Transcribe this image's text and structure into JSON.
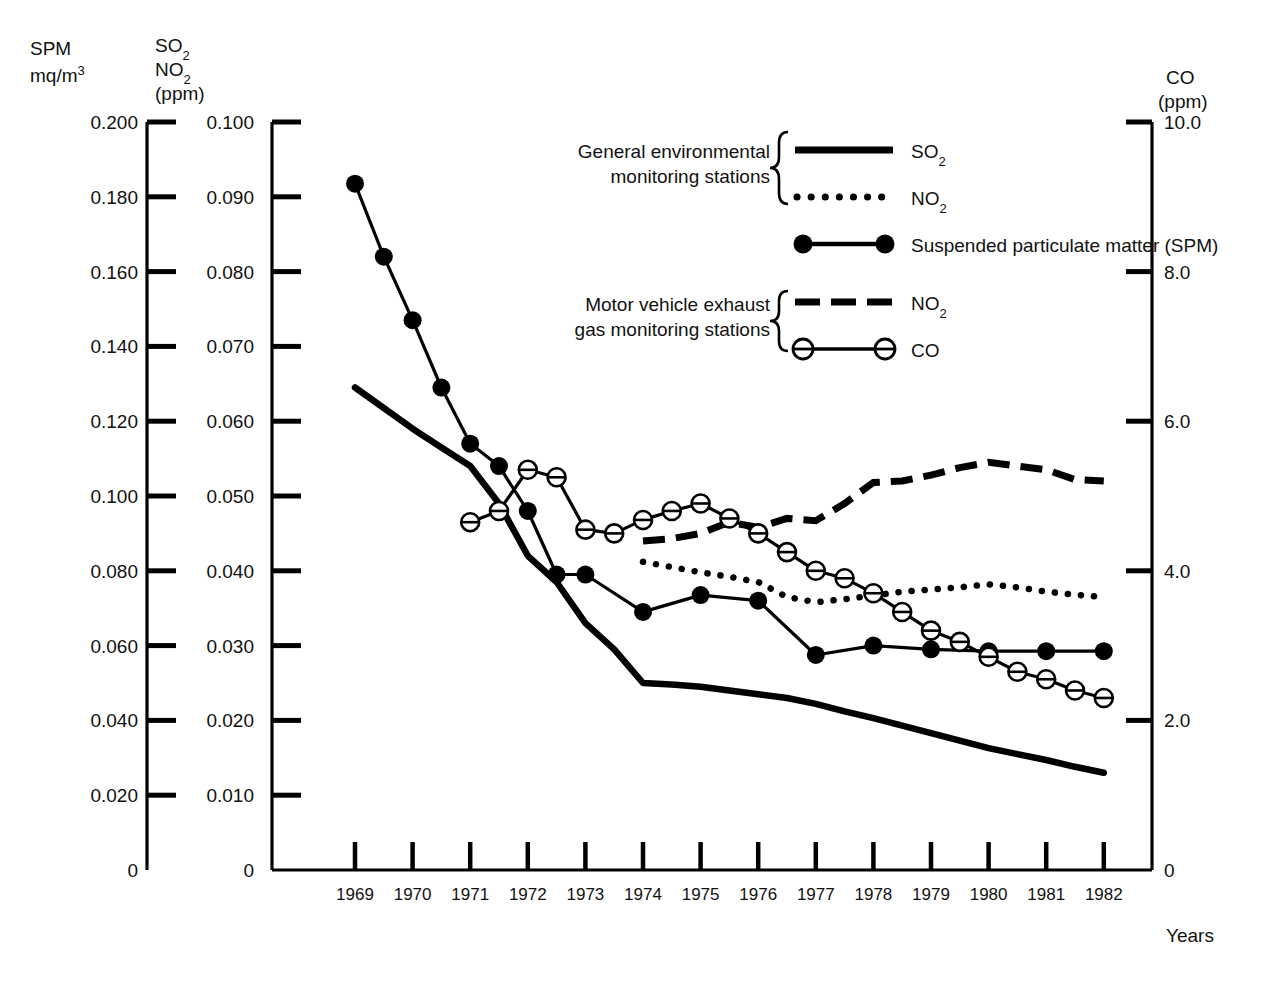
{
  "axes": {
    "left_outer": {
      "title_line1": "SPM",
      "title_line2_main": "mq/m",
      "title_line2_sup": "3",
      "ticks": [
        "0.200",
        "0.180",
        "0.160",
        "0.140",
        "0.120",
        "0.100",
        "0.080",
        "0.060",
        "0.040",
        "0.020",
        "0"
      ],
      "values": [
        0.2,
        0.18,
        0.16,
        0.14,
        0.12,
        0.1,
        0.08,
        0.06,
        0.04,
        0.02,
        0
      ]
    },
    "left_inner": {
      "title_line1_main": "SO",
      "title_line1_sub": "2",
      "title_line2_main": "NO",
      "title_line2_sub": "2",
      "title_line3": "(ppm)",
      "ticks": [
        "0.100",
        "0.090",
        "0.080",
        "0.070",
        "0.060",
        "0.050",
        "0.040",
        "0.030",
        "0.020",
        "0.010",
        "0"
      ],
      "values": [
        0.1,
        0.09,
        0.08,
        0.07,
        0.06,
        0.05,
        0.04,
        0.03,
        0.02,
        0.01,
        0
      ]
    },
    "right": {
      "title_line1": "CO",
      "title_line2": "(ppm)",
      "ticks": [
        "10.0",
        "8.0",
        "6.0",
        "4.0",
        "2.0",
        "0"
      ],
      "values": [
        10.0,
        8.0,
        6.0,
        4.0,
        2.0,
        0
      ]
    },
    "x": {
      "label": "Years",
      "ticks": [
        "1969",
        "1970",
        "1971",
        "1972",
        "1973",
        "1974",
        "1975",
        "1976",
        "1977",
        "1978",
        "1979",
        "1980",
        "1981",
        "1982"
      ]
    }
  },
  "legend": {
    "group1_line1": "General environmental",
    "group1_line2": "monitoring stations",
    "group2_line1": "Motor vehicle exhaust",
    "group2_line2": "gas monitoring stations",
    "items": [
      {
        "style": "solid-thick",
        "label_main": "SO",
        "label_sub": "2",
        "label_tail": ""
      },
      {
        "style": "dotted",
        "label_main": "NO",
        "label_sub": "2",
        "label_tail": ""
      },
      {
        "style": "line-filled-dots",
        "label_main": "Suspended particulate matter (SPM)",
        "label_sub": "",
        "label_tail": ""
      },
      {
        "style": "dashed",
        "label_main": "NO",
        "label_sub": "2",
        "label_tail": ""
      },
      {
        "style": "line-open-dots",
        "label_main": "CO",
        "label_sub": "",
        "label_tail": ""
      }
    ]
  },
  "chart_data": {
    "type": "line",
    "title": "",
    "xlabel": "Years",
    "grid": false,
    "legend_position": "top-center",
    "x": [
      1969,
      1970,
      1971,
      1972,
      1973,
      1974,
      1975,
      1976,
      1977,
      1978,
      1979,
      1980,
      1981,
      1982
    ],
    "xlim": [
      1968.6,
      1982.6
    ],
    "series": [
      {
        "name": "SO2 (general environmental monitoring stations)",
        "axis": "left_inner",
        "unit": "ppm",
        "style": "solid-thick",
        "x": [
          1969.0,
          1970.0,
          1970.5,
          1971.0,
          1971.5,
          1972.0,
          1972.5,
          1973.0,
          1973.5,
          1974.0,
          1974.5,
          1975.0,
          1975.5,
          1976.0,
          1976.5,
          1977.0,
          1977.5,
          1978.0,
          1978.5,
          1979.0,
          1979.5,
          1980.0,
          1980.5,
          1981.0,
          1981.5,
          1982.0
        ],
        "y": [
          0.0645,
          0.059,
          0.0565,
          0.054,
          0.049,
          0.042,
          0.0385,
          0.033,
          0.0295,
          0.025,
          0.0248,
          0.0245,
          0.024,
          0.0235,
          0.023,
          0.0222,
          0.0212,
          0.0203,
          0.0193,
          0.0183,
          0.0173,
          0.0163,
          0.0155,
          0.0147,
          0.0138,
          0.013
        ],
        "ylim": [
          0,
          0.1
        ]
      },
      {
        "name": "NO2 (general environmental monitoring stations)",
        "axis": "left_inner",
        "unit": "ppm",
        "style": "dotted",
        "x": [
          1974.0,
          1974.5,
          1975.0,
          1975.5,
          1976.0,
          1976.5,
          1977.0,
          1977.5,
          1978.0,
          1978.5,
          1979.0,
          1979.5,
          1980.0,
          1980.5,
          1981.0,
          1981.5,
          1982.0
        ],
        "y": [
          0.0412,
          0.0405,
          0.0398,
          0.0392,
          0.0385,
          0.0365,
          0.0358,
          0.0362,
          0.0367,
          0.0372,
          0.0375,
          0.0378,
          0.0382,
          0.0378,
          0.0372,
          0.0368,
          0.0365
        ],
        "ylim": [
          0,
          0.1
        ]
      },
      {
        "name": "Suspended particulate matter (SPM)",
        "axis": "left_outer",
        "unit": "mq/m3",
        "style": "line-filled-dots",
        "x": [
          1969.0,
          1969.5,
          1970.0,
          1970.5,
          1971.0,
          1971.5,
          1972.0,
          1972.5,
          1973.0,
          1974.0,
          1975.0,
          1976.0,
          1977.0,
          1978.0,
          1979.0,
          1980.0,
          1981.0,
          1982.0
        ],
        "y": [
          0.1835,
          0.164,
          0.147,
          0.129,
          0.114,
          0.108,
          0.096,
          0.079,
          0.079,
          0.069,
          0.0735,
          0.072,
          0.0575,
          0.06,
          0.059,
          0.0585,
          0.0585,
          0.0585
        ],
        "ylim": [
          0,
          0.2
        ]
      },
      {
        "name": "NO2 (motor vehicle exhaust gas monitoring stations)",
        "axis": "left_inner",
        "unit": "ppm",
        "style": "dashed",
        "x": [
          1974.0,
          1974.5,
          1975.0,
          1975.5,
          1976.0,
          1976.5,
          1977.0,
          1977.5,
          1978.0,
          1978.5,
          1979.0,
          1979.5,
          1980.0,
          1980.5,
          1981.0,
          1981.5,
          1982.0
        ],
        "y": [
          0.044,
          0.0443,
          0.045,
          0.0465,
          0.0458,
          0.047,
          0.0467,
          0.049,
          0.0518,
          0.052,
          0.0528,
          0.0538,
          0.0545,
          0.054,
          0.0535,
          0.0522,
          0.052
        ],
        "ylim": [
          0,
          0.1
        ]
      },
      {
        "name": "CO (motor vehicle exhaust gas monitoring stations)",
        "axis": "right",
        "unit": "ppm",
        "style": "line-open-dots",
        "x": [
          1971.0,
          1971.5,
          1972.0,
          1972.5,
          1973.0,
          1973.5,
          1974.0,
          1974.5,
          1975.0,
          1975.5,
          1976.0,
          1976.5,
          1977.0,
          1977.5,
          1978.0,
          1978.5,
          1979.0,
          1979.5,
          1980.0,
          1980.5,
          1981.0,
          1981.5,
          1982.0
        ],
        "y": [
          4.65,
          4.8,
          5.35,
          5.25,
          4.55,
          4.5,
          4.68,
          4.8,
          4.9,
          4.7,
          4.5,
          4.25,
          4.0,
          3.9,
          3.7,
          3.45,
          3.2,
          3.05,
          2.85,
          2.65,
          2.55,
          2.4,
          2.3
        ],
        "ylim": [
          0,
          10.0
        ]
      }
    ]
  }
}
